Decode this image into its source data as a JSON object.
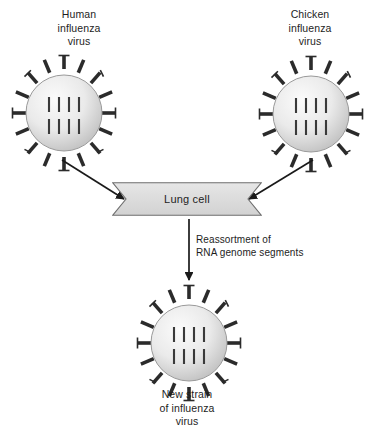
{
  "figure": {
    "background_color": "#ffffff",
    "type": "biology-process-diagram"
  },
  "nodes": {
    "human_virus": {
      "label": "Human\ninfluenza\nvirus",
      "label_lines": [
        "Human",
        "influenza",
        "virus"
      ],
      "spike_count": 16,
      "genome_segments": 8,
      "body_color": "#e8e8e8",
      "spike_color": "#2b2b2b",
      "segment_color": "#3a3a3a",
      "center": {
        "x": 64,
        "y": 107
      },
      "radius": 38
    },
    "chicken_virus": {
      "label": "Chicken\ninfluenza\nvirus",
      "label_lines": [
        "Chicken",
        "influenza",
        "virus"
      ],
      "spike_count": 16,
      "genome_segments": 8,
      "body_color": "#e8e8e8",
      "spike_color": "#2b2b2b",
      "segment_color": "#3a3a3a",
      "center": {
        "x": 311,
        "y": 108
      },
      "radius": 38
    },
    "new_virus": {
      "label": "New strain\nof influenza\nvirus",
      "label_lines": [
        "New strain",
        "of influenza",
        "virus"
      ],
      "spike_count": 16,
      "genome_segments": 8,
      "body_color": "#e8e8e8",
      "spike_color": "#2b2b2b",
      "segment_color": "#3a3a3a",
      "center": {
        "x": 189,
        "y": 337
      },
      "radius": 38
    },
    "lung_cell": {
      "label": "Lung cell",
      "shape": "ribbon-banner",
      "fill_color": "#dcdcdc",
      "stroke_color": "#6e6e6e",
      "x": 112,
      "y": 182,
      "width": 150,
      "height": 34
    }
  },
  "annotations": {
    "reassortment": {
      "label": "Reassortment of\nRNA genome segments",
      "label_lines": [
        "Reassortment of",
        "RNA genome segments"
      ]
    }
  },
  "arrows": [
    {
      "name": "human-to-lung-cell",
      "from": "human_virus",
      "to": "lung_cell",
      "direction": "down-right",
      "color": "#1a1a1a"
    },
    {
      "name": "chicken-to-lung-cell",
      "from": "chicken_virus",
      "to": "lung_cell",
      "direction": "down-left",
      "color": "#1a1a1a"
    },
    {
      "name": "lung-cell-to-new-virus",
      "from": "lung_cell",
      "to": "new_virus",
      "direction": "down",
      "color": "#1a1a1a"
    }
  ]
}
